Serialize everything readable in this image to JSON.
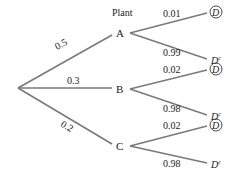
{
  "title": "Plant",
  "root": {
    "x": 18,
    "y": 88
  },
  "nodes": [
    {
      "label": "A",
      "prob": "0.5",
      "x": 120,
      "y": 33,
      "leaves": [
        {
          "label": "D",
          "circled": true,
          "prob": "0.01"
        },
        {
          "label": "D",
          "sup": "c",
          "circled": false,
          "prob": "0.99"
        }
      ]
    },
    {
      "label": "B",
      "prob": "0.3",
      "x": 120,
      "y": 89,
      "leaves": [
        {
          "label": "D",
          "circled": true,
          "prob": "0.02"
        },
        {
          "label": "D",
          "sup": "c",
          "circled": false,
          "prob": "0.98"
        }
      ]
    },
    {
      "label": "C",
      "prob": "0.2",
      "x": 120,
      "y": 146,
      "leaves": [
        {
          "label": "D",
          "circled": true,
          "prob": "0.02"
        },
        {
          "label": "D",
          "sup": "c",
          "circled": false,
          "prob": "0.98"
        }
      ]
    }
  ],
  "colors": {
    "line": "#7a7a7a",
    "text": "#222222"
  }
}
